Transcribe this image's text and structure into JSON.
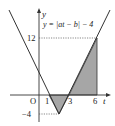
{
  "diagram": {
    "equation": "y = |at − b| − 4",
    "axis_labels": {
      "x": "t",
      "y": "y",
      "origin": "O"
    },
    "x_ticks": [
      "1",
      "3",
      "6"
    ],
    "y_ticks": [
      "12",
      "−4"
    ],
    "vertex": {
      "t": 2,
      "y": -4
    },
    "points": [
      {
        "t": 1,
        "y": 0
      },
      {
        "t": 3,
        "y": 0
      },
      {
        "t": 6,
        "y": 12
      }
    ],
    "shaded_regions": [
      {
        "from_t": 1,
        "to_t": 3,
        "description": "triangle below t-axis"
      },
      {
        "from_t": 3,
        "to_t": 6,
        "description": "triangle above t-axis"
      }
    ],
    "colors": {
      "line": "#333333",
      "fill": "#a6a6a6",
      "dotted": "#555555"
    }
  }
}
